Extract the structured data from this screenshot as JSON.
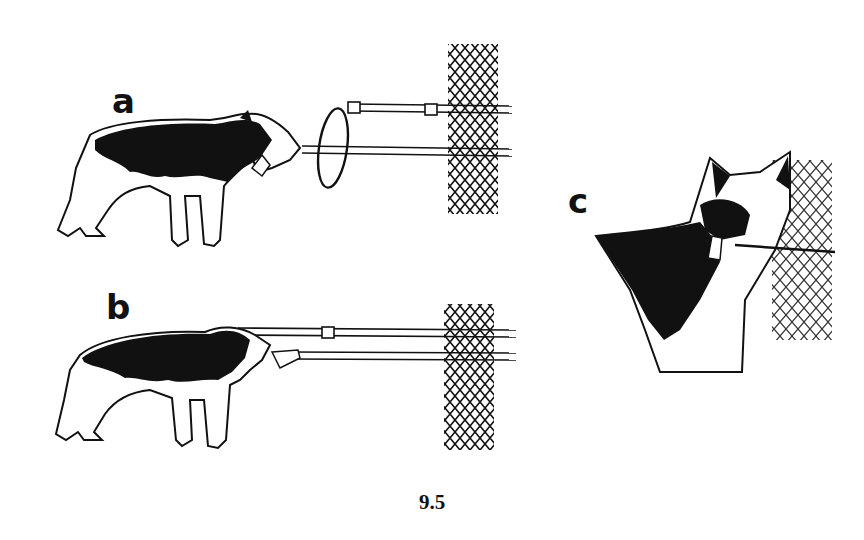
{
  "figure": {
    "number": "9.5",
    "panels": [
      {
        "label": "a",
        "description": "Dog standing, biting a loop attached to a catch-pole passing through a chain-link fence"
      },
      {
        "label": "b",
        "description": "Dog standing, pulling on a catch-pole passing through a chain-link fence"
      },
      {
        "label": "c",
        "description": "Close-up of dog's head holding a pole in its mouth beside a chain-link fence"
      }
    ]
  },
  "colors": {
    "ink": "#111111",
    "paper": "#ffffff"
  }
}
